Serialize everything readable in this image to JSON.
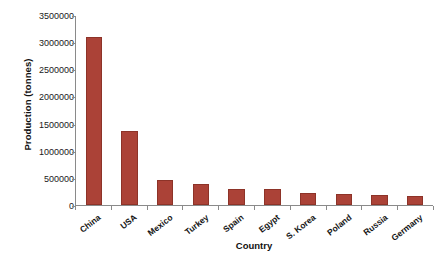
{
  "chart_data": {
    "type": "bar",
    "title": "",
    "xlabel": "Country",
    "ylabel": "Production (tonnes)",
    "categories": [
      "China",
      "USA",
      "Mexico",
      "Turkey",
      "Spain",
      "Egypt",
      "S. Korea",
      "Poland",
      "Russia",
      "Germany"
    ],
    "values": [
      3100000,
      1370000,
      460000,
      390000,
      300000,
      290000,
      215000,
      205000,
      190000,
      165000
    ],
    "ylim": [
      0,
      3500000
    ],
    "yticks": [
      0,
      500000,
      1000000,
      1500000,
      2000000,
      2500000,
      3000000,
      3500000
    ],
    "ytick_labels": [
      "0",
      "500000",
      "1000000",
      "1500000",
      "2000000",
      "2500000",
      "3000000",
      "3500000"
    ],
    "grid": false,
    "legend": false,
    "legend_position": "none",
    "bar_color": "#ab4237",
    "bar_border_color": "#8d3328",
    "axis_color": "#8a8a8a",
    "background_color": "#ffffff",
    "xtick_rotation": -38
  }
}
